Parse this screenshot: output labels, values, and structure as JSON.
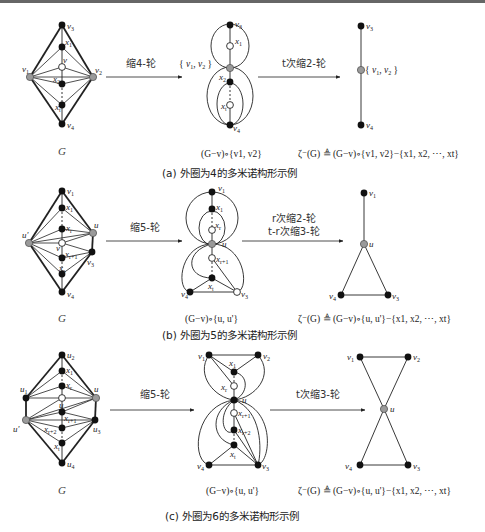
{
  "figure": {
    "panels": [
      {
        "id": "a",
        "graph_label": "G",
        "arrow1_label": "缩4-轮",
        "arrow2_label": "t次缩2-轮",
        "merged_label": "{v1, v2}",
        "middle_formula": "(G−v)∘{v1, v2}",
        "right_formula": "ζ⁻(G) ≜ (G−v)∘{v1, v2}−{x1, x2, ⋯, xt}",
        "caption": "(a) 外圈为4的多米诺构形示例",
        "vertices": {
          "G": [
            "v1",
            "v2",
            "v3",
            "v4",
            "v",
            "x1",
            "x2",
            "xt"
          ],
          "middle": [
            "v3",
            "x1",
            "{v1,v2}",
            "x2",
            "xt",
            "v4"
          ],
          "right": [
            "v3",
            "{v1,v2}",
            "v4"
          ]
        }
      },
      {
        "id": "b",
        "graph_label": "G",
        "arrow1_label": "缩5-轮",
        "arrow2_label_line1": "r次缩2-轮",
        "arrow2_label_line2": "t-r次缩3-轮",
        "middle_formula": "(G−v)∘{u, u'}",
        "right_formula": "ζ⁻(G) ≜ (G−v)∘{u, u'}−{x1, x2, ⋯, xt}",
        "caption": "(b) 外圈为5的多米诺构形示例",
        "vertices": {
          "G": [
            "v1",
            "u'",
            "u",
            "v3",
            "v4",
            "v",
            "x1",
            "xr",
            "xr+1",
            "xs"
          ],
          "middle": [
            "v1",
            "x1",
            "xr",
            "u",
            "xr+1",
            "xt",
            "v4",
            "v3"
          ],
          "right": [
            "v1",
            "u",
            "v4",
            "v3"
          ]
        }
      },
      {
        "id": "c",
        "graph_label": "G",
        "arrow1_label": "缩5-轮",
        "arrow2_label": "t次缩3-轮",
        "middle_formula": "(G−v)∘{u, u'}",
        "right_formula": "ζ⁻(G) ≜ (G−v)∘{u, u'}−{x1, x2, ⋯, xt}",
        "caption": "(c) 外圈为6的多米诺构形示例",
        "vertices": {
          "G": [
            "u1",
            "u2",
            "u",
            "u'",
            "u3",
            "u4",
            "v",
            "x1",
            "xr",
            "xr+1",
            "xr+2",
            "xt"
          ],
          "middle": [
            "v1",
            "v2",
            "x1",
            "xr",
            "u",
            "xr+1",
            "xr+2",
            "xt",
            "v4",
            "v3"
          ],
          "right": [
            "v1",
            "v2",
            "u",
            "v4",
            "v3"
          ]
        }
      }
    ],
    "colors": {
      "edge": "#222222",
      "black_vertex": "#111111",
      "grey_vertex": "#9a9a9a",
      "white_vertex": "#ffffff"
    }
  }
}
